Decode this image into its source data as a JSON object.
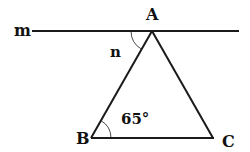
{
  "diagram": {
    "type": "geometry",
    "colors": {
      "stroke": "#1a1a1a",
      "text": "#111111",
      "background": "#ffffff"
    },
    "line": {
      "label": "m"
    },
    "vertices": {
      "A": {
        "label": "A"
      },
      "B": {
        "label": "B"
      },
      "C": {
        "label": "C"
      }
    },
    "angles": {
      "n": {
        "label": "n",
        "location": "between line m and segment AB at A"
      },
      "B": {
        "label": "65°",
        "location": "angle ABC at B"
      }
    }
  }
}
